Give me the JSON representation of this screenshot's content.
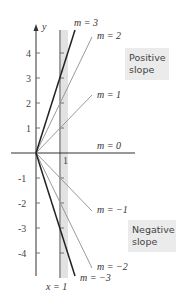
{
  "diagram": {
    "y_axis_label": "y",
    "y_ticks": [
      "4",
      "3",
      "2",
      "1",
      "-1",
      "-2",
      "-3",
      "-4"
    ],
    "x_tick_label": "1",
    "vertical_line_label": "x = 1",
    "lines": [
      {
        "label": "m = 3",
        "slope": 3
      },
      {
        "label": "m = 2",
        "slope": 2
      },
      {
        "label": "m = 1",
        "slope": 1
      },
      {
        "label": "m = 0",
        "slope": 0
      },
      {
        "label": "m = −1",
        "slope": -1
      },
      {
        "label": "m = −2",
        "slope": -2
      },
      {
        "label": "m = −3",
        "slope": -3
      }
    ],
    "positive_box": {
      "line1": "Positive",
      "line2": "slope"
    },
    "negative_box": {
      "line1": "Negative",
      "line2": "slope"
    },
    "colors": {
      "dark_line": "#222222",
      "light_line": "#9a9a9a",
      "band": "#dcdcdc",
      "box": "#ebebeb"
    }
  }
}
